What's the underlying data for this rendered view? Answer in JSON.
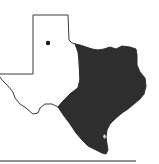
{
  "map": {
    "subject": "Texas state outline",
    "background_color": "#ffffff",
    "outline_color": "#3a3a3a",
    "shaded_region": {
      "description": "Eastern, central and southern Texas shaded",
      "fill_color": "#2e2e2e"
    },
    "marker": {
      "type": "dot",
      "location": "Texas panhandle",
      "color": "#1a1a1a"
    },
    "baseline": {
      "color": "#6e6e6e"
    }
  }
}
